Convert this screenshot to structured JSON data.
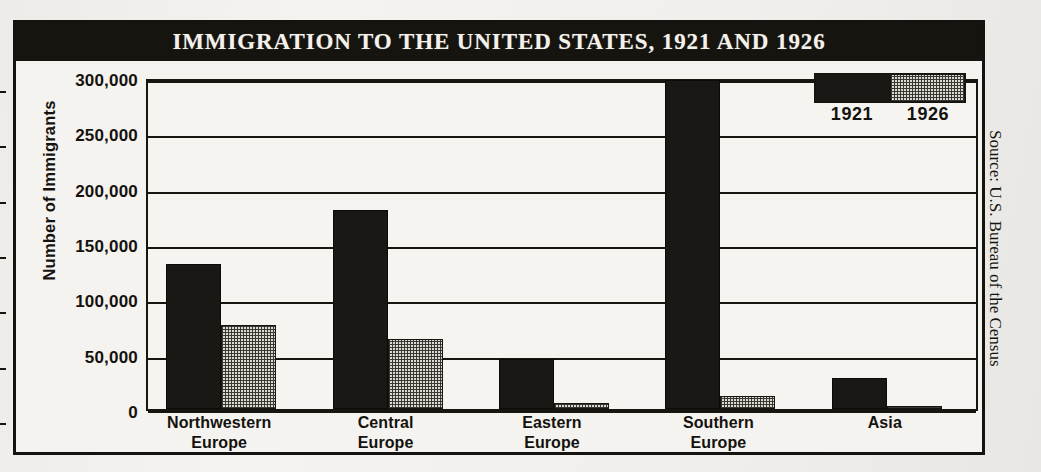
{
  "figure": {
    "title": "IMMIGRATION TO THE UNITED STATES, 1921 AND 1926",
    "source_note": "Source: U.S. Bureau of the Census"
  },
  "legend": {
    "series_1_label": "1921",
    "series_2_label": "1926",
    "series_1_color": "#1a1814",
    "series_2_color": "#dcdad4"
  },
  "axis": {
    "y_title": "Number of Immigrants",
    "ticks": [
      "300,000",
      "250,000",
      "200,000",
      "150,000",
      "100,000",
      "50,000",
      "0"
    ]
  },
  "categories_display": [
    {
      "line1": "Northwestern",
      "line2": "Europe"
    },
    {
      "line1": "Central",
      "line2": "Europe"
    },
    {
      "line1": "Eastern",
      "line2": "Europe"
    },
    {
      "line1": "Southern",
      "line2": "Europe"
    },
    {
      "line1": "Asia",
      "line2": ""
    }
  ],
  "chart_data": {
    "type": "bar",
    "title": "IMMIGRATION TO THE UNITED STATES, 1921 AND 1926",
    "xlabel": "",
    "ylabel": "Number of Immigrants",
    "categories": [
      "Northwestern Europe",
      "Central Europe",
      "Eastern Europe",
      "Southern Europe",
      "Asia"
    ],
    "series": [
      {
        "name": "1921",
        "values": [
          131000,
          180000,
          45000,
          297000,
          28000
        ]
      },
      {
        "name": "1926",
        "values": [
          76000,
          63000,
          5000,
          12000,
          2500
        ]
      }
    ],
    "ylim": [
      0,
      300000
    ],
    "ytick_values": [
      0,
      50000,
      100000,
      150000,
      200000,
      250000,
      300000
    ],
    "ytick_labels": [
      "0",
      "50,000",
      "100,000",
      "150,000",
      "200,000",
      "250,000",
      "300,000"
    ],
    "grid": true,
    "legend_position": "top-right",
    "source": "Source: U.S. Bureau of the Census"
  }
}
